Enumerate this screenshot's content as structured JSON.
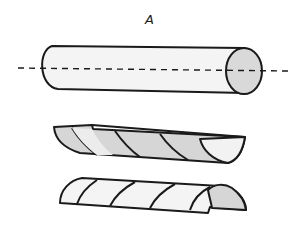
{
  "figure": {
    "label": "A",
    "parts": [
      {
        "name": "whole-cylinder",
        "position": "top"
      },
      {
        "name": "upper-half-shell",
        "position": "middle",
        "orientation": "concave, opening up"
      },
      {
        "name": "lower-half-shell",
        "position": "bottom",
        "orientation": "convex, dome"
      }
    ],
    "colors": {
      "stroke": "#1a1a1a",
      "body_fill": "#f4f4f4",
      "end_cap_fill": "#d9d9d9",
      "stripe_fill": "#d6d6d6",
      "background": "#ffffff"
    }
  }
}
